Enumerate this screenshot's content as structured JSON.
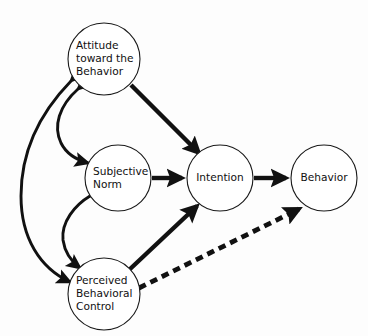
{
  "diagram": {
    "background_color": "#fdfdfd",
    "line_color": "#111111",
    "node_fill": "#ffffff",
    "nodes": [
      {
        "id": "attitude",
        "label": "Attitude toward the Behavior",
        "lines": [
          "Attitude",
          "toward the",
          "Behavior"
        ],
        "cx": 104,
        "cy": 59,
        "r": 36
      },
      {
        "id": "subjective-norm",
        "label": "Subjective Norm",
        "lines": [
          "Subjective",
          "Norm"
        ],
        "cx": 118,
        "cy": 178,
        "r": 33
      },
      {
        "id": "perceived-behavioral-control",
        "label": "Perceived Behavioral Control",
        "lines": [
          "Perceived",
          "Behavioral",
          "Control"
        ],
        "cx": 104,
        "cy": 294,
        "r": 36
      },
      {
        "id": "intention",
        "label": "Intention",
        "lines": [
          "Intention"
        ],
        "cx": 220,
        "cy": 178,
        "r": 33
      },
      {
        "id": "behavior",
        "label": "Behavior",
        "lines": [
          "Behavior"
        ],
        "cx": 324,
        "cy": 178,
        "r": 33
      }
    ],
    "edges": [
      {
        "id": "attitude-to-intention",
        "from": "attitude",
        "to": "intention",
        "style": "solid-thick",
        "arrows": "single"
      },
      {
        "id": "subjective-norm-to-intention",
        "from": "subjective-norm",
        "to": "intention",
        "style": "solid-thick",
        "arrows": "single"
      },
      {
        "id": "perceived-behavioral-control-to-intention",
        "from": "perceived-behavioral-control",
        "to": "intention",
        "style": "solid-thick",
        "arrows": "single"
      },
      {
        "id": "intention-to-behavior",
        "from": "intention",
        "to": "behavior",
        "style": "solid-thick",
        "arrows": "single"
      },
      {
        "id": "perceived-behavioral-control-to-behavior",
        "from": "perceived-behavioral-control",
        "to": "behavior",
        "style": "dashed-thick",
        "arrows": "single"
      },
      {
        "id": "attitude-subjective-norm-correlation",
        "from": "attitude",
        "to": "subjective-norm",
        "style": "curved",
        "arrows": "double"
      },
      {
        "id": "subjective-norm-perceived-behavioral-control-correlation",
        "from": "subjective-norm",
        "to": "perceived-behavioral-control",
        "style": "curved",
        "arrows": "double"
      },
      {
        "id": "attitude-perceived-behavioral-control-correlation",
        "from": "attitude",
        "to": "perceived-behavioral-control",
        "style": "curved-outer",
        "arrows": "double"
      }
    ]
  }
}
